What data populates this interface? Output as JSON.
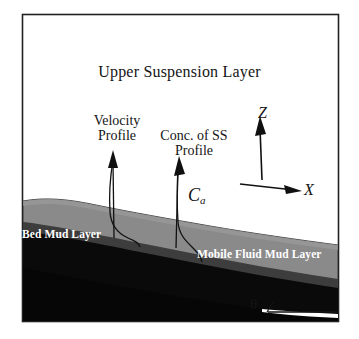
{
  "figure": {
    "name": "mud-layer-schematic",
    "border_color": "#222222",
    "background": "#ffffff"
  },
  "labels": {
    "title": "Upper Suspension Layer",
    "velocity_profile": "Velocity\nProfile",
    "conc_profile": "Conc. of SS\nProfile",
    "bed_mud_layer": "Bed Mud Layer",
    "mobile_fluid_mud_layer": "Mobile Fluid Mud Layer",
    "near_bed_concentration": "C",
    "near_bed_concentration_sub": "a",
    "theta": "θ"
  },
  "axes": {
    "vertical_label": "Z",
    "horizontal_label": "X"
  },
  "colors": {
    "upper_suspension": "#ffffff",
    "mobile_fluid_mud": "#8a8a8a",
    "bed_mud_dark": "#3a3a3a",
    "bed_mud_black": "#080808",
    "outline": "#1a1a1a",
    "label_text": "#151515",
    "mud_label_text": "#ffffff"
  },
  "icons": {
    "z_axis_arrow": "arrow-up-icon",
    "x_axis_arrow": "arrow-right-icon",
    "velocity_arrow": "arrow-up-icon",
    "conc_arrow": "arrow-up-icon",
    "angle_marker": "angle-icon"
  }
}
